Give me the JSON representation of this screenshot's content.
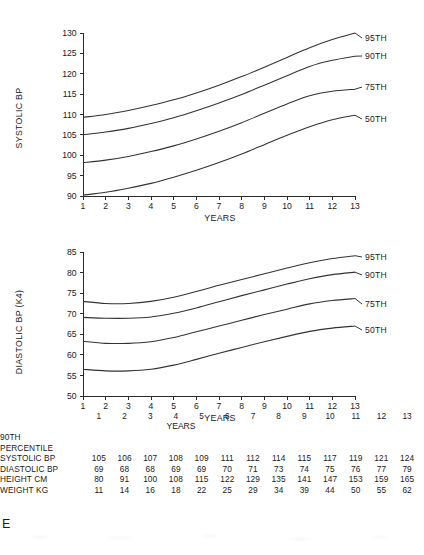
{
  "panel": {
    "letter": "E"
  },
  "chart_data": [
    {
      "type": "line",
      "id": "systolic",
      "title": "",
      "xlabel": "YEARS",
      "ylabel": "SYSTOLIC BP",
      "x": [
        1,
        2,
        3,
        4,
        5,
        6,
        7,
        8,
        9,
        10,
        11,
        12,
        13
      ],
      "xlim": [
        1,
        13
      ],
      "ylim": [
        90,
        130
      ],
      "yticks": [
        90,
        95,
        100,
        105,
        110,
        115,
        120,
        125,
        130
      ],
      "xticks": [
        1,
        2,
        3,
        4,
        5,
        6,
        7,
        8,
        9,
        10,
        11,
        12,
        13
      ],
      "grid": false,
      "legend_position": "right-inline-labels",
      "series": [
        {
          "name": "95TH",
          "values": [
            109.3,
            110.0,
            111.0,
            112.2,
            113.6,
            115.3,
            117.2,
            119.3,
            121.6,
            124.0,
            126.4,
            128.4,
            130.0
          ]
        },
        {
          "name": "90TH",
          "values": [
            105.0,
            105.7,
            106.6,
            107.8,
            109.2,
            110.9,
            112.8,
            114.9,
            117.2,
            119.5,
            121.8,
            123.3,
            124.3
          ]
        },
        {
          "name": "75TH",
          "values": [
            98.2,
            98.8,
            99.7,
            100.9,
            102.3,
            104.0,
            105.9,
            108.0,
            110.3,
            112.6,
            114.6,
            115.7,
            116.2
          ]
        },
        {
          "name": "50TH",
          "values": [
            90.2,
            90.9,
            91.9,
            93.1,
            94.6,
            96.3,
            98.2,
            100.3,
            102.6,
            104.9,
            107.0,
            108.7,
            109.8
          ]
        }
      ]
    },
    {
      "type": "line",
      "id": "diastolic",
      "title": "",
      "xlabel": "YEARS",
      "ylabel": "DIASTOLIC BP (K4)",
      "x": [
        1,
        2,
        3,
        4,
        5,
        6,
        7,
        8,
        9,
        10,
        11,
        12,
        13
      ],
      "xlim": [
        1,
        13
      ],
      "ylim": [
        50,
        85
      ],
      "yticks": [
        50,
        55,
        60,
        65,
        70,
        75,
        80,
        85
      ],
      "xticks": [
        1,
        2,
        3,
        4,
        5,
        6,
        7,
        8,
        9,
        10,
        11,
        12,
        13
      ],
      "grid": false,
      "legend_position": "right-inline-labels",
      "series": [
        {
          "name": "95TH",
          "values": [
            73.0,
            72.5,
            72.5,
            73.0,
            74.0,
            75.4,
            76.9,
            78.3,
            79.7,
            81.1,
            82.4,
            83.4,
            84.1
          ]
        },
        {
          "name": "90TH",
          "values": [
            69.1,
            68.9,
            68.9,
            69.2,
            70.1,
            71.4,
            72.9,
            74.4,
            75.8,
            77.2,
            78.5,
            79.5,
            80.1
          ]
        },
        {
          "name": "75TH",
          "values": [
            63.3,
            62.8,
            62.8,
            63.2,
            64.2,
            65.6,
            67.0,
            68.4,
            69.8,
            71.1,
            72.4,
            73.2,
            73.7
          ]
        },
        {
          "name": "50TH",
          "values": [
            56.5,
            56.1,
            56.1,
            56.5,
            57.5,
            58.9,
            60.4,
            61.8,
            63.2,
            64.5,
            65.7,
            66.5,
            67.0
          ]
        }
      ]
    }
  ],
  "table": {
    "header_lines": [
      "90TH",
      "PERCENTILE"
    ],
    "years_label": "YEARS",
    "column_headers": [
      "1",
      "2",
      "3",
      "4",
      "5",
      "6",
      "7",
      "8",
      "9",
      "10",
      "11",
      "12",
      "13"
    ],
    "rows": [
      {
        "label": "SYSTOLIC BP",
        "values": [
          "105",
          "106",
          "107",
          "108",
          "109",
          "111",
          "112",
          "114",
          "115",
          "117",
          "119",
          "121",
          "124"
        ]
      },
      {
        "label": "DIASTOLIC BP",
        "values": [
          "69",
          "68",
          "68",
          "69",
          "69",
          "70",
          "71",
          "73",
          "74",
          "75",
          "76",
          "77",
          "79"
        ]
      },
      {
        "label": "HEIGHT CM",
        "values": [
          "80",
          "91",
          "100",
          "108",
          "115",
          "122",
          "129",
          "135",
          "141",
          "147",
          "153",
          "159",
          "165"
        ]
      },
      {
        "label": "WEIGHT KG",
        "values": [
          "11",
          "14",
          "16",
          "18",
          "22",
          "25",
          "29",
          "34",
          "39",
          "44",
          "50",
          "55",
          "62"
        ]
      }
    ]
  },
  "colors": {
    "ink": "#1a1a1a",
    "curve": "#333333",
    "axis": "#2a2a2a",
    "background": "#ffffff"
  }
}
